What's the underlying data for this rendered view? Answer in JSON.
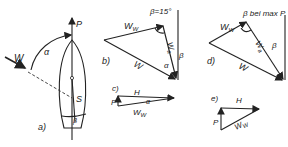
{
  "figure": {
    "panels": [
      {
        "id": "a",
        "label": "a)",
        "description": "sailboat top view with wind direction and heading",
        "labels": {
          "wind": "W",
          "angle_alpha": "α",
          "propulsion": "P",
          "sail": "S",
          "beta": "β"
        }
      },
      {
        "id": "b",
        "label": "b)",
        "description": "wind vector triangle at β = 15°",
        "title": "β=15°",
        "labels": {
          "ww": "W",
          "ww_sub": "W",
          "wa": "W",
          "wa_sub": "a",
          "w": "W",
          "beta": "β",
          "alpha": "α"
        }
      },
      {
        "id": "c",
        "label": "c)",
        "description": "force triangle for b",
        "labels": {
          "h": "H",
          "p": "P",
          "ww": "W",
          "ww_sub": "W",
          "alpha": "α"
        }
      },
      {
        "id": "d",
        "label": "d)",
        "description": "wind vector triangle at β for max P",
        "title": "β bei max P",
        "labels": {
          "ww": "W",
          "ww_sub": "W",
          "wa": "W",
          "wa_sub": "a",
          "w": "W",
          "beta": "β"
        }
      },
      {
        "id": "e",
        "label": "e)",
        "description": "force triangle for d",
        "labels": {
          "h": "H",
          "p": "P",
          "ww": "W",
          "ww_sub": "W"
        }
      }
    ]
  }
}
